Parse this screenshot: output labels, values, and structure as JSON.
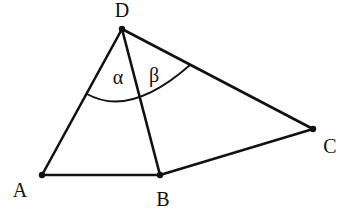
{
  "figure": {
    "type": "quadrilateral-with-diagonal",
    "points": {
      "A": {
        "label": "A",
        "x": 42,
        "y": 175
      },
      "B": {
        "label": "B",
        "x": 160,
        "y": 175
      },
      "C": {
        "label": "C",
        "x": 313,
        "y": 129
      },
      "D": {
        "label": "D",
        "x": 122,
        "y": 29
      }
    },
    "segments": [
      "DA",
      "DB",
      "DC",
      "AB",
      "BC"
    ],
    "angles": {
      "alpha": {
        "label": "α",
        "vertex": "D",
        "between": [
          "DA",
          "DB"
        ]
      },
      "beta": {
        "label": "β",
        "vertex": "D",
        "between": [
          "DB",
          "DC"
        ]
      }
    },
    "colors": {
      "stroke": "#111111",
      "background": "#ffffff"
    }
  }
}
